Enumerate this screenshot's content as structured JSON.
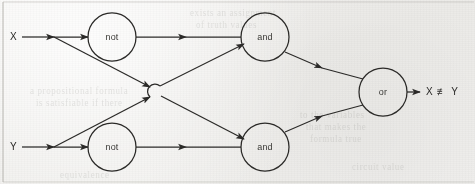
{
  "figure": {
    "kind": "logic-circuit-diagram",
    "background_color": "#f2f1ef",
    "ink_color": "#2b2a28",
    "border_color": "#b9b7b2"
  },
  "inputs": [
    {
      "id": "x",
      "label": "X",
      "x": 14,
      "y": 37
    },
    {
      "id": "y",
      "label": "Y",
      "x": 14,
      "y": 147
    }
  ],
  "outputs": [
    {
      "id": "out",
      "label": "X ≢̸ Y",
      "text": "X ≢ Y",
      "x": 428,
      "y": 92
    }
  ],
  "nodes": [
    {
      "id": "not_top",
      "label": "not",
      "cx": 112,
      "cy": 37,
      "r": 24
    },
    {
      "id": "not_bot",
      "label": "not",
      "cx": 112,
      "cy": 147,
      "r": 24
    },
    {
      "id": "and_top",
      "label": "and",
      "cx": 265,
      "cy": 37,
      "r": 24
    },
    {
      "id": "and_bot",
      "label": "and",
      "cx": 265,
      "cy": 147,
      "r": 24
    },
    {
      "id": "or_gate",
      "label": "or",
      "cx": 383,
      "cy": 92,
      "r": 24
    }
  ],
  "edges": [
    {
      "id": "x-to-not-top",
      "from": "x",
      "to": "not_top"
    },
    {
      "id": "x-to-and-bot",
      "from": "x",
      "to": "and_bot"
    },
    {
      "id": "y-to-not-bot",
      "from": "y",
      "to": "not_bot"
    },
    {
      "id": "y-to-and-top",
      "from": "y",
      "to": "and_top"
    },
    {
      "id": "not-top-to-and-top",
      "from": "not_top",
      "to": "and_top"
    },
    {
      "id": "not-bot-to-and-bot",
      "from": "not_bot",
      "to": "and_bot"
    },
    {
      "id": "and-top-to-or",
      "from": "and_top",
      "to": "or_gate"
    },
    {
      "id": "and-bot-to-or",
      "from": "and_bot",
      "to": "or_gate"
    },
    {
      "id": "or-to-out",
      "from": "or_gate",
      "to": "out"
    }
  ],
  "bleed_text": [
    {
      "text": "a propositional formula",
      "x": 30,
      "y": 86,
      "rot": 0
    },
    {
      "text": "is satisfiable if there",
      "x": 36,
      "y": 98,
      "rot": 0
    },
    {
      "text": "exists an assignment",
      "x": 190,
      "y": 8,
      "rot": 0
    },
    {
      "text": "of truth values",
      "x": 196,
      "y": 20,
      "rot": 0
    },
    {
      "text": "to the variables",
      "x": 300,
      "y": 110,
      "rot": 0
    },
    {
      "text": "that makes the",
      "x": 306,
      "y": 122,
      "rot": 0
    },
    {
      "text": "formula true",
      "x": 310,
      "y": 134,
      "rot": 0
    },
    {
      "text": "circuit value",
      "x": 352,
      "y": 162,
      "rot": 0
    },
    {
      "text": "equivalence",
      "x": 60,
      "y": 170,
      "rot": 0
    }
  ]
}
